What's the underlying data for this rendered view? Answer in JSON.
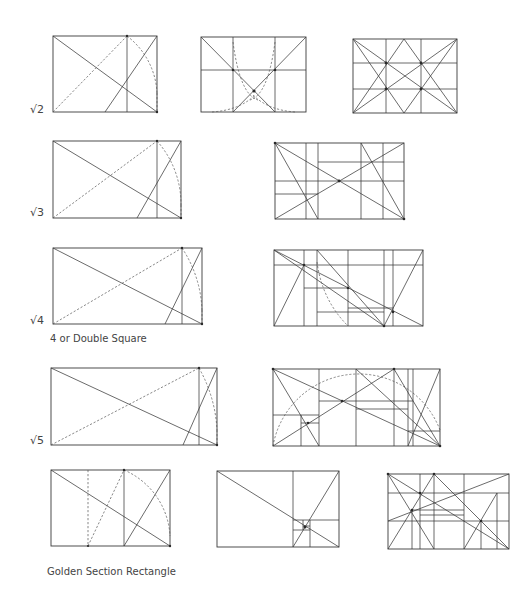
{
  "rows": [
    {
      "id": "root2",
      "label": "√2",
      "caption": "",
      "figures": [
        "root2-a",
        "root2-b",
        "root2-c"
      ]
    },
    {
      "id": "root3",
      "label": "√3",
      "caption": "",
      "figures": [
        "root3-a",
        "root3-b"
      ]
    },
    {
      "id": "root4",
      "label": "√4",
      "caption": "4 or Double Square",
      "figures": [
        "root4-a",
        "root4-b"
      ]
    },
    {
      "id": "root5",
      "label": "√5",
      "caption": "",
      "figures": [
        "root5-a",
        "root5-b"
      ]
    },
    {
      "id": "golden",
      "label": "",
      "caption": "Golden Section Rectangle",
      "figures": [
        "golden-a",
        "golden-b",
        "golden-c"
      ]
    }
  ],
  "labels": {
    "root2": "√2",
    "root3": "√3",
    "root4": "√4",
    "root5": "√5",
    "double_square_caption": "4 or Double Square",
    "golden_caption": "Golden Section Rectangle"
  },
  "line_color": "#3a3a3a",
  "background": "#ffffff"
}
